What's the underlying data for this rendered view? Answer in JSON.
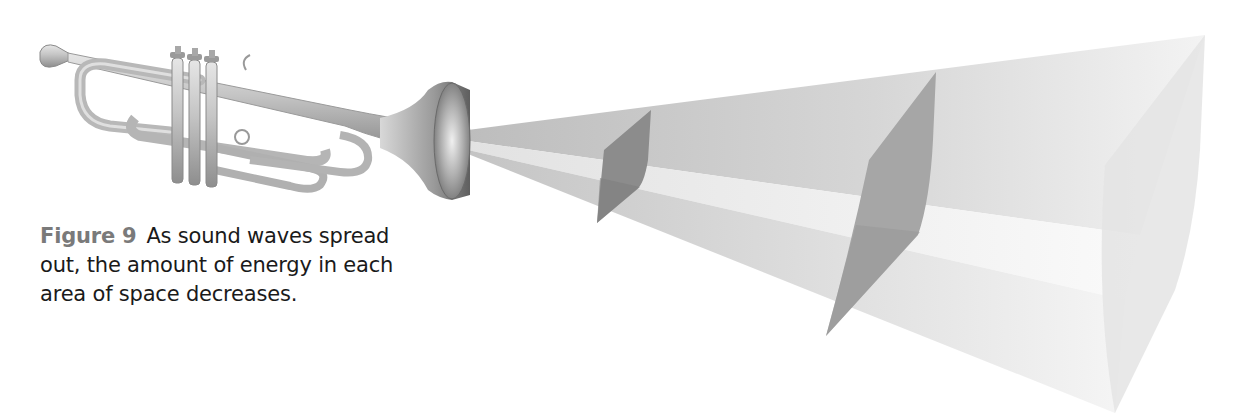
{
  "figure": {
    "label": "Figure 9",
    "caption": "As sound waves spread out, the amount of energy in each area of space decreases.",
    "label_color": "#7a7a7a",
    "text_color": "#1a1a1a"
  },
  "illustration": {
    "source_object": "trumpet",
    "wave_model": "expanding-cone",
    "wavefront_slices": 3,
    "colors": {
      "cone_upper": "#c8c8c8",
      "cone_band": "#ececec",
      "cone_lower": "#d0d0d0",
      "slice_1": "#8a8a8a",
      "slice_2": "#a4a4a4",
      "slice_3": "#e6e6e6",
      "trumpet_metal": "#b8b8b8"
    }
  }
}
